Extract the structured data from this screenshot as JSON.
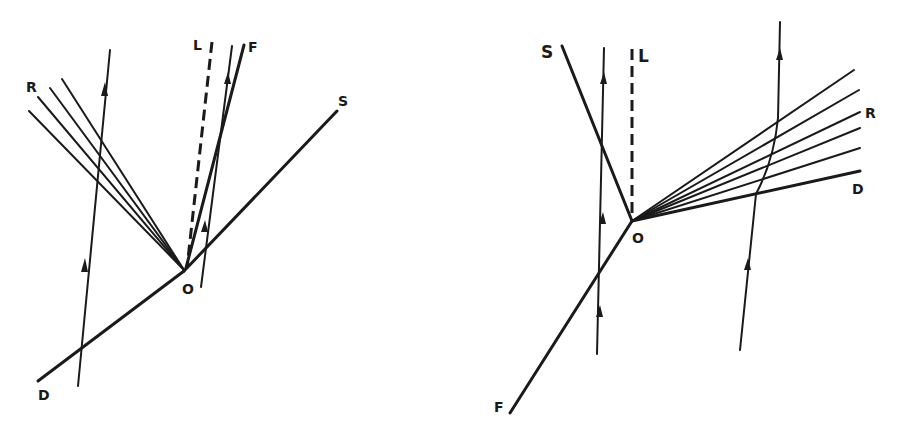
{
  "figure": {
    "background": "#ffffff",
    "ink": "#1a1a1a",
    "left_diagram": {
      "labels": {
        "R": "R",
        "L": "L",
        "F": "F",
        "S": "S",
        "O": "O",
        "D": "D"
      }
    },
    "right_diagram": {
      "labels": {
        "S": "S",
        "L": "L",
        "R": "R",
        "D": "D",
        "O": "O",
        "F": "F"
      }
    }
  }
}
